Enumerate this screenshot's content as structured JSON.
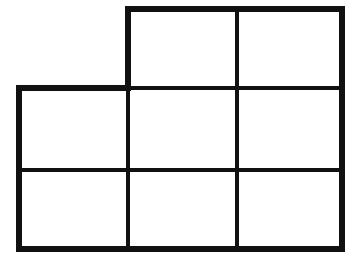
{
  "figure": {
    "shape_name": "L-shaped grid of eight unit squares",
    "canvas": {
      "width": 357,
      "height": 261,
      "background_color": "#FFFFFF"
    },
    "style": {
      "line_color": "#111111",
      "outer_stroke_width": 6,
      "inner_stroke_width": 4,
      "line_cap": "butt",
      "line_join": "miter",
      "fill_color": "#FFFFFF"
    },
    "grid": {
      "columns": 3,
      "rows": 3,
      "total_cells_possible": 9,
      "filled_cells": 8,
      "empty_cells": 1,
      "column_x": [
        19,
        128,
        237,
        342
      ],
      "row_y": [
        9,
        88,
        170,
        249
      ],
      "column_widths": [
        109,
        109,
        105
      ],
      "row_heights": [
        79,
        82,
        79
      ]
    },
    "cells": [
      {
        "id": "cell-r1c1",
        "row": 1,
        "col": 1,
        "present": false,
        "x": 19,
        "y": 9,
        "w": 109,
        "h": 79
      },
      {
        "id": "cell-r1c2",
        "row": 1,
        "col": 2,
        "present": true,
        "x": 128,
        "y": 9,
        "w": 109,
        "h": 79
      },
      {
        "id": "cell-r1c3",
        "row": 1,
        "col": 3,
        "present": true,
        "x": 237,
        "y": 9,
        "w": 105,
        "h": 79
      },
      {
        "id": "cell-r2c1",
        "row": 2,
        "col": 1,
        "present": true,
        "x": 19,
        "y": 88,
        "w": 109,
        "h": 82
      },
      {
        "id": "cell-r2c2",
        "row": 2,
        "col": 2,
        "present": true,
        "x": 128,
        "y": 88,
        "w": 109,
        "h": 82
      },
      {
        "id": "cell-r2c3",
        "row": 2,
        "col": 3,
        "present": true,
        "x": 237,
        "y": 88,
        "w": 105,
        "h": 82
      },
      {
        "id": "cell-r3c1",
        "row": 3,
        "col": 1,
        "present": true,
        "x": 19,
        "y": 170,
        "w": 109,
        "h": 79
      },
      {
        "id": "cell-r3c2",
        "row": 3,
        "col": 2,
        "present": true,
        "x": 128,
        "y": 170,
        "w": 109,
        "h": 79
      },
      {
        "id": "cell-r3c3",
        "row": 3,
        "col": 3,
        "present": true,
        "x": 237,
        "y": 170,
        "w": 105,
        "h": 79
      }
    ],
    "outline_path": "M 128 9 L 342 9 L 342 249 L 19 249 L 19 88 L 128 88 Z",
    "interior_lines": [
      {
        "id": "v-divider-1",
        "orientation": "vertical",
        "x1": 128,
        "y1": 88,
        "x2": 128,
        "y2": 249
      },
      {
        "id": "v-divider-2",
        "orientation": "vertical",
        "x1": 237,
        "y1": 9,
        "x2": 237,
        "y2": 249
      },
      {
        "id": "h-divider-1",
        "orientation": "horizontal",
        "x1": 128,
        "y1": 88,
        "x2": 342,
        "y2": 88
      },
      {
        "id": "h-divider-2",
        "orientation": "horizontal",
        "x1": 19,
        "y1": 170,
        "x2": 342,
        "y2": 170
      }
    ],
    "labels": []
  }
}
